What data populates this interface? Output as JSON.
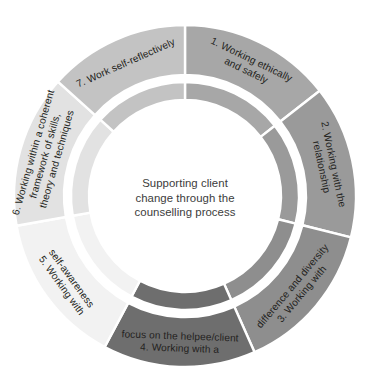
{
  "diagram": {
    "type": "donut-ring",
    "title": "Supporting client change through the counselling process",
    "center": {
      "lines": [
        "Supporting client",
        "change through the",
        "counselling process"
      ],
      "text_color": "#3c3c3c"
    },
    "geometry": {
      "cx": 185,
      "cy": 196,
      "outer_radius": 171,
      "ring_gap_outer": 121,
      "ring_gap_inner": 114,
      "inner_radius": 96,
      "start_angle_deg": -90,
      "segment_count": 7
    },
    "segments": [
      {
        "index": 1,
        "number": "1.",
        "label": "1. Working ethically and safely",
        "lines": [
          "1. Working ethically",
          "and safely"
        ],
        "color": "#a7a7a7",
        "inner_color": "#a7a7a7",
        "start_deg": -90,
        "end_deg": -38,
        "text_color": "#231f20"
      },
      {
        "index": 2,
        "number": "2.",
        "label": "2. Working with the relationship",
        "lines": [
          "2. Working with the",
          "relationship"
        ],
        "color": "#9a9a9a",
        "inner_color": "#9a9a9a",
        "start_deg": -38,
        "end_deg": 14,
        "text_color": "#231f20"
      },
      {
        "index": 3,
        "number": "3.",
        "label": "3. Working with difference and diversity",
        "lines": [
          "3. Working with",
          "difference and diversity"
        ],
        "color": "#8e8e8e",
        "inner_color": "#8e8e8e",
        "start_deg": 14,
        "end_deg": 66,
        "text_color": "#231f20"
      },
      {
        "index": 4,
        "number": "4.",
        "label": "4. Working with a focus on the helpee/client",
        "lines": [
          "4. Working with a",
          "focus on the helpee/client"
        ],
        "color": "#6e6e6e",
        "inner_color": "#6e6e6e",
        "start_deg": 66,
        "end_deg": 118,
        "text_color": "#f2f2f2"
      },
      {
        "index": 5,
        "number": "5.",
        "label": "5. Working with self-awareness",
        "lines": [
          "5. Working with",
          "self-awareness"
        ],
        "color": "#f2f2f2",
        "inner_color": "#f2f2f2",
        "start_deg": 118,
        "end_deg": 170,
        "text_color": "#231f20"
      },
      {
        "index": 6,
        "number": "6.",
        "label": "6. Working within a coherent framework of skills, theory and techniques",
        "lines": [
          "6. Working within a coherent",
          "framework of skills,",
          "theory and techniques"
        ],
        "color": "#e2e2e2",
        "inner_color": "#e2e2e2",
        "start_deg": 170,
        "end_deg": 222,
        "text_color": "#231f20"
      },
      {
        "index": 7,
        "number": "7.",
        "label": "7. Work self-reflectively",
        "lines": [
          "7. Work self-reflectively"
        ],
        "color": "#c3c3c3",
        "inner_color": "#c3c3c3",
        "start_deg": 222,
        "end_deg": 270,
        "text_color": "#231f20"
      }
    ],
    "divider_color": "#ffffff",
    "background": "#ffffff"
  }
}
